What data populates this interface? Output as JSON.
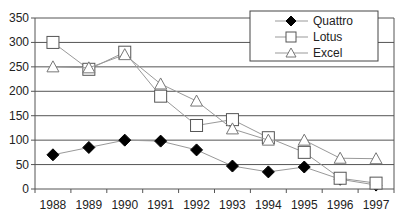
{
  "chart_data": {
    "type": "line",
    "title": "",
    "xlabel": "",
    "ylabel": "",
    "categories": [
      "1988",
      "1989",
      "1990",
      "1991",
      "1992",
      "1993",
      "1994",
      "1995",
      "1996",
      "1997"
    ],
    "series": [
      {
        "name": "Quattro",
        "marker": "filled-diamond",
        "values": [
          70,
          85,
          100,
          98,
          80,
          47,
          35,
          45,
          20,
          8
        ]
      },
      {
        "name": "Lotus",
        "marker": "open-square",
        "values": [
          300,
          245,
          280,
          190,
          130,
          142,
          105,
          75,
          22,
          12
        ]
      },
      {
        "name": "Excel",
        "marker": "open-triangle",
        "values": [
          250,
          248,
          275,
          215,
          180,
          123,
          100,
          100,
          63,
          62
        ]
      }
    ],
    "ylim": [
      0,
      350
    ],
    "yticks": [
      0,
      50,
      100,
      150,
      200,
      250,
      300,
      350
    ],
    "grid": true,
    "legend_position": "top-right",
    "colors": {
      "line": "#999999",
      "marker_fill": "#000000",
      "grid": "#555555",
      "axis": "#555555"
    }
  }
}
